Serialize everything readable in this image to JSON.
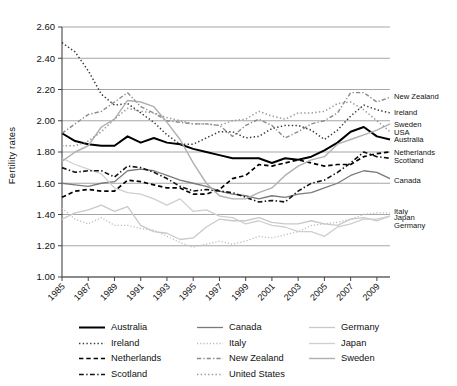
{
  "chart_data": {
    "type": "line",
    "title": "",
    "xlabel": "",
    "ylabel": "Fertility rates",
    "ylim": [
      1.0,
      2.6
    ],
    "ytick_labels": [
      "1.00",
      "1.20",
      "1.40",
      "1.60",
      "1.80",
      "2.00",
      "2.20",
      "2.40",
      "2.60"
    ],
    "ytick_values": [
      1.0,
      1.2,
      1.4,
      1.6,
      1.8,
      2.0,
      2.2,
      2.4,
      2.6
    ],
    "grid": "horizontal",
    "legend_position": "bottom",
    "x": [
      1985,
      1986,
      1987,
      1988,
      1989,
      1990,
      1991,
      1992,
      1993,
      1994,
      1995,
      1996,
      1997,
      1998,
      1999,
      2000,
      2001,
      2002,
      2003,
      2004,
      2005,
      2006,
      2007,
      2008,
      2009,
      2010
    ],
    "xtick_labels": [
      "1985",
      "1987",
      "1989",
      "1991",
      "1993",
      "1995",
      "1997",
      "1999",
      "2001",
      "2003",
      "2005",
      "2007",
      "2009"
    ],
    "xtick_values": [
      1985,
      1987,
      1989,
      1991,
      1993,
      1995,
      1997,
      1999,
      2001,
      2003,
      2005,
      2007,
      2009
    ],
    "series": [
      {
        "name": "Australia",
        "color": "#000000",
        "style": "solid",
        "width": 2.0,
        "right_label": "Australia",
        "values": [
          1.92,
          1.87,
          1.85,
          1.84,
          1.84,
          1.9,
          1.86,
          1.89,
          1.86,
          1.85,
          1.82,
          1.8,
          1.78,
          1.76,
          1.76,
          1.76,
          1.73,
          1.76,
          1.75,
          1.77,
          1.81,
          1.86,
          1.93,
          1.96,
          1.9,
          1.88
        ]
      },
      {
        "name": "Canada",
        "color": "#7a7a7a",
        "style": "solid",
        "width": 1.3,
        "right_label": "Canada",
        "values": [
          1.6,
          1.59,
          1.58,
          1.6,
          1.61,
          1.68,
          1.69,
          1.68,
          1.65,
          1.62,
          1.6,
          1.58,
          1.55,
          1.53,
          1.52,
          1.5,
          1.52,
          1.51,
          1.53,
          1.54,
          1.57,
          1.6,
          1.65,
          1.68,
          1.67,
          1.63
        ]
      },
      {
        "name": "Germany",
        "color": "#c9c9c9",
        "style": "solid",
        "width": 1.3,
        "right_label": "Germany",
        "values": [
          1.37,
          1.41,
          1.43,
          1.46,
          1.42,
          1.45,
          1.33,
          1.29,
          1.28,
          1.24,
          1.25,
          1.32,
          1.37,
          1.36,
          1.36,
          1.38,
          1.35,
          1.34,
          1.34,
          1.36,
          1.34,
          1.33,
          1.37,
          1.38,
          1.36,
          1.39
        ]
      },
      {
        "name": "Ireland",
        "color": "#3a3a3a",
        "style": "dotted",
        "width": 1.5,
        "right_label": "Ireland",
        "values": [
          2.5,
          2.44,
          2.32,
          2.17,
          2.1,
          2.11,
          2.05,
          1.99,
          1.91,
          1.85,
          1.85,
          1.89,
          1.93,
          1.93,
          1.89,
          1.9,
          1.95,
          1.97,
          1.97,
          1.94,
          1.88,
          1.94,
          2.03,
          2.1,
          2.07,
          2.05
        ]
      },
      {
        "name": "Italy",
        "color": "#bdbdbd",
        "style": "dotted",
        "width": 1.3,
        "right_label": "Italy",
        "values": [
          1.44,
          1.37,
          1.34,
          1.38,
          1.33,
          1.33,
          1.31,
          1.3,
          1.26,
          1.22,
          1.19,
          1.21,
          1.23,
          1.21,
          1.23,
          1.26,
          1.25,
          1.27,
          1.29,
          1.33,
          1.34,
          1.35,
          1.37,
          1.4,
          1.41,
          1.41
        ]
      },
      {
        "name": "Japan",
        "color": "#cfcfcf",
        "style": "solid",
        "width": 1.3,
        "right_label": "Japan",
        "values": [
          1.76,
          1.72,
          1.69,
          1.66,
          1.57,
          1.54,
          1.53,
          1.5,
          1.46,
          1.5,
          1.42,
          1.43,
          1.39,
          1.38,
          1.34,
          1.36,
          1.33,
          1.32,
          1.29,
          1.29,
          1.26,
          1.32,
          1.34,
          1.37,
          1.37,
          1.39
        ]
      },
      {
        "name": "Netherlands",
        "color": "#000000",
        "style": "dashed",
        "width": 1.7,
        "right_label": "Netherlands",
        "values": [
          1.51,
          1.55,
          1.56,
          1.55,
          1.55,
          1.62,
          1.61,
          1.59,
          1.57,
          1.57,
          1.53,
          1.53,
          1.56,
          1.63,
          1.65,
          1.72,
          1.71,
          1.73,
          1.75,
          1.73,
          1.71,
          1.72,
          1.72,
          1.77,
          1.79,
          1.8
        ]
      },
      {
        "name": "New Zealand",
        "color": "#8a8a8a",
        "style": "dashdot",
        "width": 1.4,
        "right_label": "New Zealand",
        "values": [
          1.92,
          1.98,
          2.04,
          2.06,
          2.12,
          2.18,
          2.09,
          2.05,
          2.0,
          1.99,
          1.98,
          1.98,
          1.97,
          1.9,
          1.97,
          2.01,
          1.97,
          1.89,
          1.93,
          1.98,
          2.0,
          2.05,
          2.18,
          2.18,
          2.12,
          2.15
        ]
      },
      {
        "name": "Scotland",
        "color": "#111111",
        "style": "dashdot",
        "width": 1.6,
        "right_label": "Scotland",
        "values": [
          1.7,
          1.67,
          1.68,
          1.68,
          1.64,
          1.71,
          1.7,
          1.67,
          1.63,
          1.58,
          1.55,
          1.56,
          1.55,
          1.54,
          1.51,
          1.48,
          1.49,
          1.48,
          1.55,
          1.6,
          1.62,
          1.67,
          1.73,
          1.8,
          1.77,
          1.76
        ]
      },
      {
        "name": "Sweden",
        "color": "#b0b0b0",
        "style": "solid",
        "width": 1.4,
        "right_label": "Sweden",
        "values": [
          1.74,
          1.8,
          1.84,
          1.96,
          2.01,
          2.13,
          2.12,
          2.09,
          1.99,
          1.88,
          1.73,
          1.6,
          1.52,
          1.5,
          1.5,
          1.54,
          1.57,
          1.65,
          1.71,
          1.75,
          1.77,
          1.85,
          1.88,
          1.91,
          1.94,
          1.98
        ]
      },
      {
        "name": "United States",
        "color": "#9a9a9a",
        "style": "dotted",
        "width": 1.5,
        "right_label": "USA",
        "values": [
          1.84,
          1.84,
          1.87,
          1.93,
          2.01,
          2.08,
          2.06,
          2.05,
          2.02,
          2.0,
          1.98,
          1.98,
          1.97,
          2.0,
          2.01,
          2.06,
          2.03,
          2.01,
          2.05,
          2.05,
          2.06,
          2.11,
          2.12,
          2.07,
          2.0,
          1.93
        ]
      }
    ],
    "right_labels": [
      {
        "text": "New Zealand",
        "y": 2.155
      },
      {
        "text": "Ireland",
        "y": 2.055
      },
      {
        "text": "Sweden",
        "y": 1.975
      },
      {
        "text": "USA",
        "y": 1.925
      },
      {
        "text": "Australia",
        "y": 1.88
      },
      {
        "text": "Netherlands",
        "y": 1.8
      },
      {
        "text": "Scotland",
        "y": 1.75
      },
      {
        "text": "Canada",
        "y": 1.62
      },
      {
        "text": "Italy",
        "y": 1.42
      },
      {
        "text": "Japan",
        "y": 1.385
      },
      {
        "text": "Germany",
        "y": 1.33
      }
    ]
  },
  "legend": {
    "items": [
      {
        "label": "Australia",
        "series": "Australia"
      },
      {
        "label": "Canada",
        "series": "Canada"
      },
      {
        "label": "Germany",
        "series": "Germany"
      },
      {
        "label": "Ireland",
        "series": "Ireland"
      },
      {
        "label": "Italy",
        "series": "Italy"
      },
      {
        "label": "Japan",
        "series": "Japan"
      },
      {
        "label": "Netherlands",
        "series": "Netherlands"
      },
      {
        "label": "New Zealand",
        "series": "New Zealand"
      },
      {
        "label": "Sweden",
        "series": "Sweden"
      },
      {
        "label": "Scotland",
        "series": "Scotland"
      },
      {
        "label": "United States",
        "series": "United States"
      },
      {
        "label": "",
        "series": ""
      }
    ]
  },
  "axis": {
    "y_title": "Fertility rates"
  },
  "colors": {
    "grid": "#9c9c9c",
    "axis": "#444444",
    "background": "#ffffff"
  }
}
